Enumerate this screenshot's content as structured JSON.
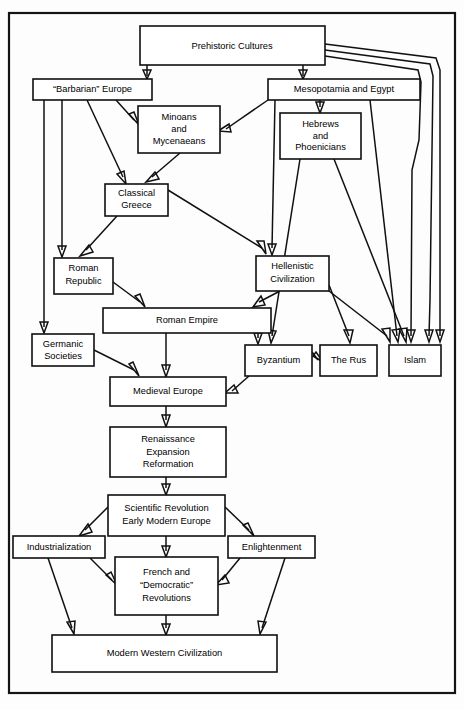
{
  "diagram": {
    "frame": {
      "x": 8,
      "y": 12,
      "w": 448,
      "h": 682
    },
    "colors": {
      "background": "#ffffff",
      "box_fill": "#ffffff",
      "line": "#101010",
      "text": "#000000"
    },
    "nodes": [
      {
        "id": "prehistoric",
        "label": "Prehistoric Cultures",
        "lines": [
          "Prehistoric Cultures"
        ],
        "x": 140,
        "y": 26,
        "w": 185,
        "h": 39
      },
      {
        "id": "barbarian_europe",
        "label": "“Barbarian” Europe",
        "lines": [
          "“Barbarian” Europe"
        ],
        "x": 33,
        "y": 79,
        "w": 119,
        "h": 21
      },
      {
        "id": "mesopotamia_egypt",
        "label": "Mesopotamia and Egypt",
        "lines": [
          "Mesopotamia and Egypt"
        ],
        "x": 268,
        "y": 79,
        "w": 152,
        "h": 21
      },
      {
        "id": "minoans_mycenaeans",
        "label": "Minoans and Mycenaeans",
        "lines": [
          "Minoans",
          "and",
          "Mycenaeans"
        ],
        "x": 138,
        "y": 106,
        "w": 82,
        "h": 47
      },
      {
        "id": "hebrews_phoenicians",
        "label": "Hebrews and Phoenicians",
        "lines": [
          "Hebrews",
          "and",
          "Phoenicians"
        ],
        "x": 280,
        "y": 113,
        "w": 81,
        "h": 46
      },
      {
        "id": "classical_greece",
        "label": "Classical Greece",
        "lines": [
          "Classical",
          "Greece"
        ],
        "x": 105,
        "y": 184,
        "w": 63,
        "h": 32
      },
      {
        "id": "roman_republic",
        "label": "Roman Republic",
        "lines": [
          "Roman",
          "Republic"
        ],
        "x": 54,
        "y": 258,
        "w": 59,
        "h": 36
      },
      {
        "id": "hellenistic_civilization",
        "label": "Hellenistic Civilization",
        "lines": [
          "Hellenistic",
          "Civilization"
        ],
        "x": 256,
        "y": 256,
        "w": 73,
        "h": 35
      },
      {
        "id": "roman_empire",
        "label": "Roman Empire",
        "lines": [
          "Roman Empire"
        ],
        "x": 103,
        "y": 308,
        "w": 168,
        "h": 25
      },
      {
        "id": "germanic_societies",
        "label": "Germanic Societies",
        "lines": [
          "Germanic",
          "Societies"
        ],
        "x": 32,
        "y": 334,
        "w": 62,
        "h": 32
      },
      {
        "id": "byzantium",
        "label": "Byzantium",
        "lines": [
          "Byzantium"
        ],
        "x": 245,
        "y": 345,
        "w": 67,
        "h": 31
      },
      {
        "id": "the_rus",
        "label": "The Rus",
        "lines": [
          "The Rus"
        ],
        "x": 320,
        "y": 345,
        "w": 57,
        "h": 31
      },
      {
        "id": "islam",
        "label": "Islam",
        "lines": [
          "Islam"
        ],
        "x": 389,
        "y": 345,
        "w": 52,
        "h": 31
      },
      {
        "id": "medieval_europe",
        "label": "Medieval Europe",
        "lines": [
          "Medieval Europe"
        ],
        "x": 110,
        "y": 377,
        "w": 116,
        "h": 29
      },
      {
        "id": "renaissance",
        "label": "Renaissance Expansion Reformation",
        "lines": [
          "Renaissance",
          "Expansion",
          "Reformation"
        ],
        "x": 110,
        "y": 427,
        "w": 116,
        "h": 50
      },
      {
        "id": "scientific_revolution",
        "label": "Scientific Revolution Early Modern Europe",
        "lines": [
          "Scientific Revolution",
          "Early Modern Europe"
        ],
        "x": 108,
        "y": 495,
        "w": 117,
        "h": 41
      },
      {
        "id": "industrialization",
        "label": "Industrialization",
        "lines": [
          "Industrialization"
        ],
        "x": 13,
        "y": 536,
        "w": 92,
        "h": 22
      },
      {
        "id": "enlightenment",
        "label": "Enlightenment",
        "lines": [
          "Enlightenment"
        ],
        "x": 228,
        "y": 536,
        "w": 87,
        "h": 22
      },
      {
        "id": "french_democratic_revolutions",
        "label": "French and “Democratic” Revolutions",
        "lines": [
          "French and",
          "“Democratic”",
          "Revolutions"
        ],
        "x": 115,
        "y": 557,
        "w": 103,
        "h": 58
      },
      {
        "id": "modern_western_civilization",
        "label": "Modern Western Civilization",
        "lines": [
          "Modern Western Civilization"
        ],
        "x": 52,
        "y": 635,
        "w": 225,
        "h": 37
      }
    ],
    "edges": [
      {
        "from": "prehistoric",
        "to": "barbarian_europe"
      },
      {
        "from": "prehistoric",
        "to": "mesopotamia_egypt"
      },
      {
        "from": "prehistoric",
        "to": "islam"
      },
      {
        "from": "prehistoric",
        "to": "islam"
      },
      {
        "from": "prehistoric",
        "to": "islam"
      },
      {
        "from": "barbarian_europe",
        "to": "minoans_mycenaeans"
      },
      {
        "from": "barbarian_europe",
        "to": "classical_greece"
      },
      {
        "from": "barbarian_europe",
        "to": "roman_republic"
      },
      {
        "from": "barbarian_europe",
        "to": "germanic_societies"
      },
      {
        "from": "mesopotamia_egypt",
        "to": "minoans_mycenaeans"
      },
      {
        "from": "mesopotamia_egypt",
        "to": "hebrews_phoenicians"
      },
      {
        "from": "mesopotamia_egypt",
        "to": "hellenistic_civilization"
      },
      {
        "from": "mesopotamia_egypt",
        "to": "islam"
      },
      {
        "from": "minoans_mycenaeans",
        "to": "classical_greece"
      },
      {
        "from": "hebrews_phoenicians",
        "to": "byzantium"
      },
      {
        "from": "hebrews_phoenicians",
        "to": "islam"
      },
      {
        "from": "classical_greece",
        "to": "roman_republic"
      },
      {
        "from": "classical_greece",
        "to": "hellenistic_civilization"
      },
      {
        "from": "roman_republic",
        "to": "roman_empire"
      },
      {
        "from": "hellenistic_civilization",
        "to": "roman_empire"
      },
      {
        "from": "hellenistic_civilization",
        "to": "the_rus"
      },
      {
        "from": "hellenistic_civilization",
        "to": "islam"
      },
      {
        "from": "roman_empire",
        "to": "medieval_europe"
      },
      {
        "from": "roman_empire",
        "to": "byzantium"
      },
      {
        "from": "germanic_societies",
        "to": "medieval_europe"
      },
      {
        "from": "byzantium",
        "to": "the_rus"
      },
      {
        "from": "byzantium",
        "to": "medieval_europe"
      },
      {
        "from": "medieval_europe",
        "to": "renaissance"
      },
      {
        "from": "renaissance",
        "to": "scientific_revolution"
      },
      {
        "from": "scientific_revolution",
        "to": "industrialization"
      },
      {
        "from": "scientific_revolution",
        "to": "enlightenment"
      },
      {
        "from": "scientific_revolution",
        "to": "french_democratic_revolutions"
      },
      {
        "from": "industrialization",
        "to": "french_democratic_revolutions"
      },
      {
        "from": "industrialization",
        "to": "modern_western_civilization"
      },
      {
        "from": "enlightenment",
        "to": "french_democratic_revolutions"
      },
      {
        "from": "enlightenment",
        "to": "modern_western_civilization"
      },
      {
        "from": "french_democratic_revolutions",
        "to": "modern_western_civilization"
      }
    ]
  }
}
